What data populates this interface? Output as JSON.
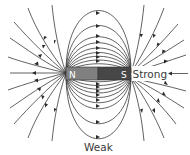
{
  "diagram": {
    "magnet": {
      "north_label": "N",
      "south_label": "S",
      "north_color": "#808080",
      "south_color": "#474747"
    },
    "labels": {
      "strong": "Strong",
      "weak": "Weak"
    },
    "line_color": "#3a3a3a"
  }
}
